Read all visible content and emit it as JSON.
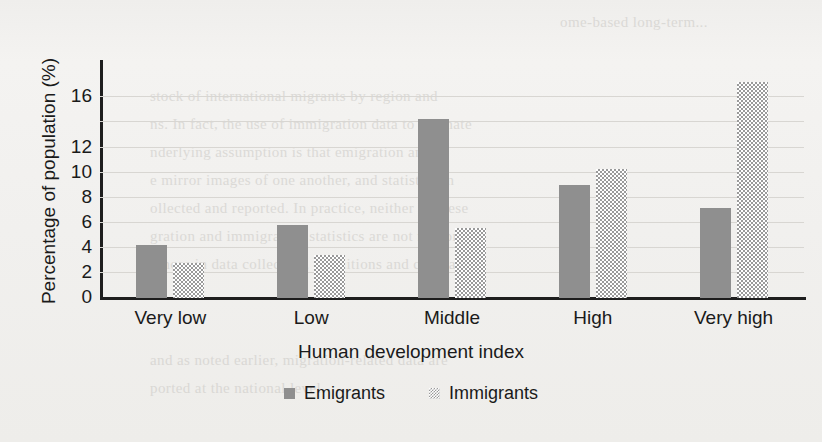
{
  "chart_data": {
    "type": "bar",
    "title": "",
    "xlabel": "Human development index",
    "ylabel": "Percentage of population (%)",
    "categories": [
      "Very low",
      "Low",
      "Middle",
      "High",
      "Very high"
    ],
    "series": [
      {
        "name": "Emigrants",
        "values": [
          4.2,
          5.8,
          14.3,
          9.0,
          7.2
        ],
        "color": "#8f8f8f",
        "fill": "solid"
      },
      {
        "name": "Immigrants",
        "values": [
          2.8,
          3.4,
          5.6,
          10.3,
          17.2
        ],
        "color": "#9a9a9a",
        "fill": "checkered"
      }
    ],
    "ylim": [
      0,
      18.5
    ],
    "ytick_labels": [
      "0",
      "2",
      "4",
      "6",
      "8",
      "10",
      "12",
      "16"
    ],
    "ytick_values": [
      0,
      2,
      4,
      6,
      8,
      10,
      12,
      16
    ],
    "gridline_values": [
      2,
      4,
      6,
      8,
      10,
      12,
      14,
      16
    ],
    "grid": true,
    "legend_position": "bottom"
  },
  "background_text": {
    "lines": [
      "ome-based long-term...",
      "stock of international migrants by region and",
      "ns. In fact, the use of immigration data to estimate",
      "nderlying assumption is that emigration and",
      "e mirror images of one another, and statistics in",
      "ollected and reported. In practice, neither of these",
      "gration and immigration statistics are not mirror",
      "rences in data collection, definitions and coverage",
      "and as noted earlier, migration-related data are",
      "ported at the national level."
    ]
  }
}
